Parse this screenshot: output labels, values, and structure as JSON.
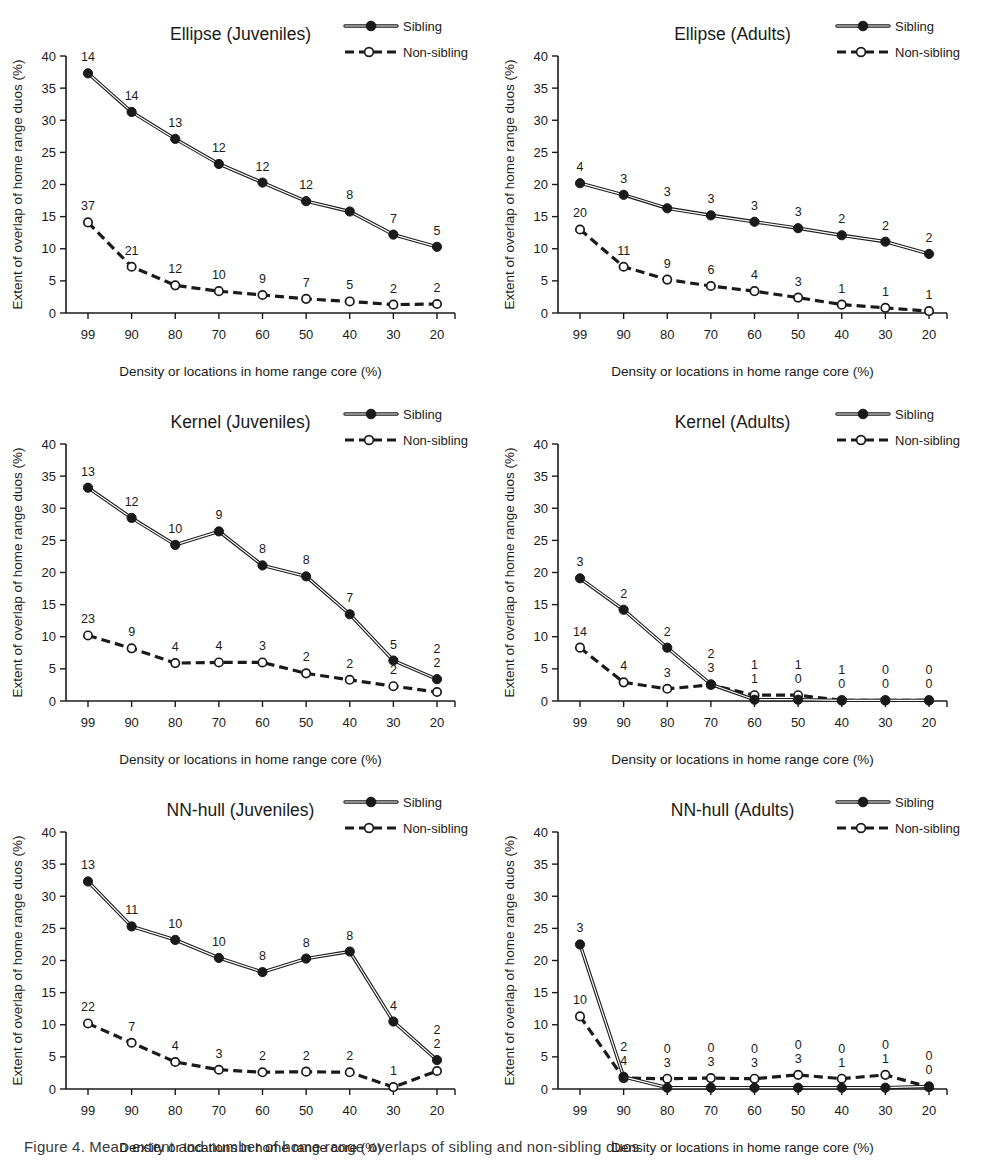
{
  "figure": {
    "caption": "Figure 4. Mean extent and number of home range overlaps of sibling and non-sibling duos",
    "x_categories": [
      99,
      90,
      80,
      70,
      60,
      50,
      40,
      30,
      20
    ],
    "y_ticks": [
      0,
      5,
      10,
      15,
      20,
      25,
      30,
      35,
      40
    ],
    "ylim": [
      0,
      40
    ],
    "xlabel": "Density or locations in home range core (%)",
    "ylabel": "Extent of overlap of home range duos (%)",
    "legend": {
      "sibling": "Sibling",
      "nonsibling": "Non-sibling",
      "sibling_marker": "filled-circle-solid-line",
      "nonsibling_marker": "open-circle-dashed-line"
    },
    "colors": {
      "ink": "#1a1a1a",
      "paper": "#ffffff"
    }
  },
  "chart_data": [
    {
      "type": "line",
      "panel_index": 0,
      "title": "Ellipse (Juveniles)",
      "xlabel": "Density or locations in home range core (%)",
      "ylabel": "Extent of overlap of home range duos (%)",
      "categories": [
        99,
        90,
        80,
        70,
        60,
        50,
        40,
        30,
        20
      ],
      "ylim": [
        0,
        40
      ],
      "grid": false,
      "legend_position": "top-right",
      "series": [
        {
          "name": "Sibling",
          "values": [
            37.3,
            31.3,
            27.1,
            23.2,
            20.3,
            17.4,
            15.8,
            12.2,
            10.3
          ],
          "labels": [
            "14",
            "14",
            "13",
            "12",
            "12",
            "12",
            "8",
            "7",
            "5"
          ]
        },
        {
          "name": "Non-sibling",
          "values": [
            14.1,
            7.2,
            4.3,
            3.4,
            2.8,
            2.2,
            1.8,
            1.3,
            1.4
          ],
          "labels": [
            "37",
            "21",
            "12",
            "10",
            "9",
            "7",
            "5",
            "2",
            "2"
          ]
        }
      ]
    },
    {
      "type": "line",
      "panel_index": 1,
      "title": "Ellipse (Adults)",
      "xlabel": "Density or locations in home range core (%)",
      "ylabel": "Extent of overlap of home range duos (%)",
      "categories": [
        99,
        90,
        80,
        70,
        60,
        50,
        40,
        30,
        20
      ],
      "ylim": [
        0,
        40
      ],
      "grid": false,
      "legend_position": "top-right",
      "series": [
        {
          "name": "Sibling",
          "values": [
            20.2,
            18.4,
            16.3,
            15.2,
            14.2,
            13.2,
            12.1,
            11.1,
            9.2
          ],
          "labels": [
            "4",
            "3",
            "3",
            "3",
            "3",
            "3",
            "2",
            "2",
            "2"
          ]
        },
        {
          "name": "Non-sibling",
          "values": [
            13.0,
            7.2,
            5.2,
            4.2,
            3.4,
            2.4,
            1.3,
            0.8,
            0.3
          ],
          "labels": [
            "20",
            "11",
            "9",
            "6",
            "4",
            "3",
            "1",
            "1",
            "1"
          ]
        }
      ]
    },
    {
      "type": "line",
      "panel_index": 2,
      "title": "Kernel (Juveniles)",
      "xlabel": "Density or locations in home range core (%)",
      "ylabel": "Extent of overlap of home range duos (%)",
      "categories": [
        99,
        90,
        80,
        70,
        60,
        50,
        40,
        30,
        20
      ],
      "ylim": [
        0,
        40
      ],
      "grid": false,
      "legend_position": "top-right",
      "series": [
        {
          "name": "Sibling",
          "values": [
            33.2,
            28.5,
            24.3,
            26.4,
            21.1,
            19.4,
            13.5,
            6.3,
            3.4
          ],
          "labels": [
            "13",
            "12",
            "10",
            "9",
            "8",
            "8",
            "7",
            "5",
            "2"
          ]
        },
        {
          "name": "Non-sibling",
          "values": [
            10.2,
            8.2,
            5.9,
            6.0,
            6.0,
            4.3,
            3.3,
            2.3,
            1.4
          ],
          "labels": [
            "23",
            "9",
            "4",
            "4",
            "3",
            "2",
            "2",
            "2",
            "2"
          ]
        }
      ]
    },
    {
      "type": "line",
      "panel_index": 3,
      "title": "Kernel (Adults)",
      "xlabel": "Density or locations in home range core (%)",
      "ylabel": "Extent of overlap of home range duos (%)",
      "categories": [
        99,
        90,
        80,
        70,
        60,
        50,
        40,
        30,
        20
      ],
      "ylim": [
        0,
        40
      ],
      "grid": false,
      "legend_position": "top-right",
      "series": [
        {
          "name": "Sibling",
          "values": [
            19.1,
            14.2,
            8.3,
            2.6,
            0.2,
            0.2,
            0.1,
            0.1,
            0.1
          ],
          "labels": [
            "3",
            "2",
            "2",
            "2",
            "1",
            "1",
            "1",
            "0",
            "0"
          ]
        },
        {
          "name": "Non-sibling",
          "values": [
            8.3,
            2.9,
            1.9,
            2.5,
            0.9,
            0.9,
            0.1,
            0.1,
            0.1
          ],
          "labels": [
            "14",
            "4",
            "3",
            "3",
            "1",
            "0",
            "0",
            "0",
            "0"
          ]
        }
      ]
    },
    {
      "type": "line",
      "panel_index": 4,
      "title": "NN-hull (Juveniles)",
      "xlabel": "Density or locations in home range core (%)",
      "ylabel": "Extent of overlap of home range duos (%)",
      "categories": [
        99,
        90,
        80,
        70,
        60,
        50,
        40,
        30,
        20
      ],
      "ylim": [
        0,
        40
      ],
      "grid": false,
      "legend_position": "top-right",
      "series": [
        {
          "name": "Sibling",
          "values": [
            32.3,
            25.3,
            23.2,
            20.4,
            18.2,
            20.3,
            21.4,
            10.5,
            4.5
          ],
          "labels": [
            "13",
            "11",
            "10",
            "10",
            "8",
            "8",
            "8",
            "4",
            "2"
          ]
        },
        {
          "name": "Non-sibling",
          "values": [
            10.2,
            7.2,
            4.2,
            3.0,
            2.6,
            2.7,
            2.6,
            0.3,
            2.8
          ],
          "labels": [
            "22",
            "7",
            "4",
            "3",
            "2",
            "2",
            "2",
            "1",
            "2"
          ]
        }
      ]
    },
    {
      "type": "line",
      "panel_index": 5,
      "title": "NN-hull (Adults)",
      "xlabel": "Density or locations in home range core (%)",
      "ylabel": "Extent of overlap of home range duos (%)",
      "categories": [
        99,
        90,
        80,
        70,
        60,
        50,
        40,
        30,
        20
      ],
      "ylim": [
        0,
        40
      ],
      "grid": false,
      "legend_position": "top-right",
      "series": [
        {
          "name": "Sibling",
          "values": [
            22.5,
            1.9,
            0.2,
            0.2,
            0.2,
            0.2,
            0.2,
            0.2,
            0.4
          ],
          "labels": [
            "3",
            "2",
            "0",
            "0",
            "0",
            "0",
            "0",
            "0",
            "0"
          ]
        },
        {
          "name": "Non-sibling",
          "values": [
            11.3,
            1.7,
            1.6,
            1.7,
            1.6,
            2.2,
            1.6,
            2.2,
            0.3
          ],
          "labels": [
            "10",
            "4",
            "3",
            "3",
            "3",
            "3",
            "1",
            "1",
            "0"
          ]
        }
      ]
    }
  ]
}
